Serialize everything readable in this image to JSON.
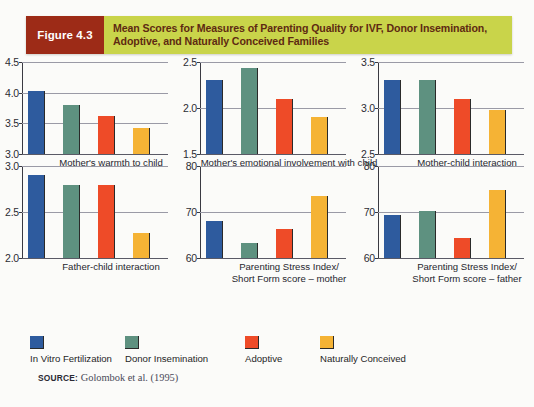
{
  "figure": {
    "tag": "Figure 4.3",
    "title": "Mean Scores for Measures of Parenting Quality for IVF, Donor Insemination, Adoptive, and Naturally Conceived Families",
    "tag_bg": "#9d2b17",
    "title_bg": "#c9d44a",
    "title_color": "#5e2a12"
  },
  "series_colors": [
    "#2e5b9e",
    "#5e9180",
    "#ee4b28",
    "#f5b335"
  ],
  "legend": {
    "items": [
      {
        "label": "In Vitro Fertilization",
        "color": "#2e5b9e"
      },
      {
        "label": "Donor Insemination",
        "color": "#5e9180"
      },
      {
        "label": "Adoptive",
        "color": "#ee4b28"
      },
      {
        "label": "Naturally Conceived",
        "color": "#f5b335"
      }
    ]
  },
  "source": {
    "label": "SOURCE:",
    "text": "Golombok et al. (1995)"
  },
  "chart_data": [
    {
      "type": "bar",
      "title": "Mother's warmth to child",
      "xlabel": "Mother's warmth to child",
      "ylabel": "",
      "categories": [
        "In Vitro Fertilization",
        "Donor Insemination",
        "Adoptive",
        "Naturally Conceived"
      ],
      "values": [
        4.02,
        3.8,
        3.62,
        3.42
      ],
      "ylim": [
        3.0,
        4.5
      ],
      "yticks": [
        "3.0",
        "3.5",
        "4.0",
        "4.5"
      ],
      "ytick_values": [
        3.0,
        3.5,
        4.0,
        4.5
      ],
      "grid": true,
      "legend_position": "bottom"
    },
    {
      "type": "bar",
      "title": "Mother's emotional involvement with child",
      "xlabel": "Mother's emotional involvement with child",
      "ylabel": "",
      "categories": [
        "In Vitro Fertilization",
        "Donor Insemination",
        "Adoptive",
        "Naturally Conceived"
      ],
      "values": [
        2.3,
        2.43,
        2.1,
        1.9
      ],
      "ylim": [
        1.5,
        2.5
      ],
      "yticks": [
        "1.5",
        "2.0",
        "2.5"
      ],
      "ytick_values": [
        1.5,
        2.0,
        2.5
      ],
      "grid": true,
      "legend_position": "bottom"
    },
    {
      "type": "bar",
      "title": "Mother-child interaction",
      "xlabel": "Mother-child interaction",
      "ylabel": "",
      "categories": [
        "In Vitro Fertilization",
        "Donor Insemination",
        "Adoptive",
        "Naturally Conceived"
      ],
      "values": [
        3.3,
        3.3,
        3.1,
        2.98
      ],
      "ylim": [
        2.5,
        3.5
      ],
      "yticks": [
        "2.5",
        "3.0",
        "3.5"
      ],
      "ytick_values": [
        2.5,
        3.0,
        3.5
      ],
      "grid": true,
      "legend_position": "bottom"
    },
    {
      "type": "bar",
      "title": "Father-child interaction",
      "xlabel": "Father-child interaction",
      "ylabel": "",
      "categories": [
        "In Vitro Fertilization",
        "Donor Insemination",
        "Adoptive",
        "Naturally Conceived"
      ],
      "values": [
        2.9,
        2.79,
        2.79,
        2.27
      ],
      "ylim": [
        2.0,
        3.0
      ],
      "yticks": [
        "2.0",
        "2.5",
        "3.0"
      ],
      "ytick_values": [
        2.0,
        2.5,
        3.0
      ],
      "grid": true,
      "legend_position": "bottom"
    },
    {
      "type": "bar",
      "title": "Parenting Stress Index/ Short Form score – mother",
      "xlabel": "Parenting Stress Index/\nShort Form score – mother",
      "ylabel": "",
      "categories": [
        "In Vitro Fertilization",
        "Donor Insemination",
        "Adoptive",
        "Naturally Conceived"
      ],
      "values": [
        68.0,
        63.3,
        66.4,
        73.5
      ],
      "ylim": [
        60,
        80
      ],
      "yticks": [
        "60",
        "70",
        "80"
      ],
      "ytick_values": [
        60,
        70,
        80
      ],
      "grid": true,
      "legend_position": "bottom"
    },
    {
      "type": "bar",
      "title": "Parenting Stress Index/ Short Form score – father",
      "xlabel": "Parenting Stress Index/\nShort Form score – father",
      "ylabel": "",
      "categories": [
        "In Vitro Fertilization",
        "Donor Insemination",
        "Adoptive",
        "Naturally Conceived"
      ],
      "values": [
        69.3,
        70.3,
        64.4,
        74.7
      ],
      "ylim": [
        60,
        80
      ],
      "yticks": [
        "60",
        "70",
        "80"
      ],
      "ytick_values": [
        60,
        70,
        80
      ],
      "grid": true,
      "legend_position": "bottom"
    }
  ]
}
